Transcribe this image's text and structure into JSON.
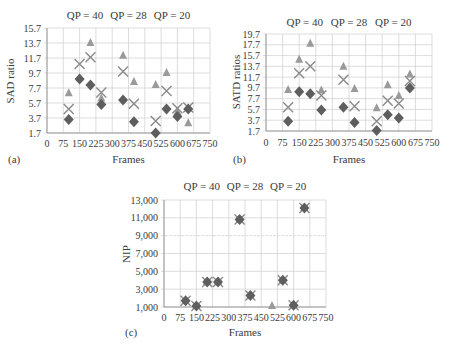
{
  "chart_data": [
    {
      "panel": "(a)",
      "type": "scatter",
      "title": "",
      "xlabel": "Frames",
      "ylabel": "SAD ratio",
      "xlim": [
        0,
        750
      ],
      "ylim": [
        1.7,
        15.7
      ],
      "xticks": [
        "0",
        "75",
        "150",
        "225",
        "300",
        "375",
        "450",
        "525",
        "600",
        "675",
        "750"
      ],
      "yticks": [
        "1.7",
        "3.7",
        "5.7",
        "7.7",
        "9.7",
        "11.7",
        "13.7",
        "15.7"
      ],
      "grid": true,
      "annotations": [
        "QP = 40",
        "QP = 28",
        "QP = 20"
      ],
      "x": [
        100,
        150,
        200,
        250,
        350,
        400,
        500,
        550,
        600,
        650
      ],
      "series": [
        {
          "name": "triangle",
          "marker": "triangle",
          "values": [
            7.0,
            9.0,
            13.7,
            6.3,
            12.0,
            8.5,
            8.1,
            9.7,
            4.5,
            3.0
          ]
        },
        {
          "name": "cross",
          "marker": "x",
          "values": [
            4.9,
            10.9,
            11.8,
            7.1,
            9.9,
            5.6,
            3.3,
            7.3,
            5.0,
            5.1
          ]
        },
        {
          "name": "diamond",
          "marker": "diamond",
          "values": [
            3.5,
            8.9,
            8.1,
            5.5,
            6.1,
            3.2,
            1.7,
            4.9,
            3.9,
            4.9
          ]
        }
      ]
    },
    {
      "panel": "(b)",
      "type": "scatter",
      "title": "",
      "xlabel": "Frames",
      "ylabel": "SATD ratios",
      "xlim": [
        0,
        750
      ],
      "ylim": [
        1.7,
        19.7
      ],
      "xticks": [
        "0",
        "75",
        "150",
        "225",
        "300",
        "375",
        "450",
        "525",
        "600",
        "675",
        "750"
      ],
      "yticks": [
        "1.7",
        "3.7",
        "5.7",
        "7.7",
        "9.7",
        "11.7",
        "13.7",
        "15.7",
        "17.7",
        "19.7"
      ],
      "grid": true,
      "annotations": [
        "QP = 40",
        "QP = 28",
        "QP = 20"
      ],
      "x": [
        100,
        150,
        200,
        250,
        350,
        400,
        500,
        550,
        600,
        650
      ],
      "series": [
        {
          "name": "triangle",
          "marker": "triangle",
          "values": [
            9.3,
            14.9,
            17.9,
            9.2,
            13.6,
            9.5,
            5.9,
            10.2,
            8.2,
            12.2
          ]
        },
        {
          "name": "cross",
          "marker": "x",
          "values": [
            6.1,
            12.4,
            13.7,
            8.3,
            11.2,
            6.3,
            3.5,
            7.3,
            6.8,
            11.0
          ]
        },
        {
          "name": "diamond",
          "marker": "diamond",
          "values": [
            3.5,
            9.0,
            8.6,
            5.6,
            6.1,
            3.3,
            1.8,
            4.7,
            4.1,
            9.7
          ]
        }
      ]
    },
    {
      "panel": "(c)",
      "type": "scatter",
      "title": "",
      "xlabel": "Frames",
      "ylabel": "NIP",
      "xlim": [
        0,
        750
      ],
      "ylim": [
        1000,
        13000
      ],
      "xticks": [
        "0",
        "75",
        "150",
        "225",
        "300",
        "375",
        "450",
        "525",
        "600",
        "675",
        "750"
      ],
      "yticks": [
        "1,000",
        "3,000",
        "5,000",
        "7,000",
        "9,000",
        "11,000",
        "13,000"
      ],
      "grid": true,
      "annotations": [
        "QP = 40",
        "QP = 28",
        "QP = 20"
      ],
      "x": [
        100,
        150,
        200,
        250,
        350,
        400,
        500,
        550,
        600,
        650
      ],
      "series": [
        {
          "name": "triangle",
          "marker": "triangle",
          "values": [
            1700,
            1100,
            3800,
            3800,
            10800,
            2300,
            1100,
            4000,
            1200,
            12100
          ]
        },
        {
          "name": "cross",
          "marker": "x",
          "values": [
            1700,
            1100,
            3800,
            3800,
            10800,
            2300,
            null,
            4000,
            1200,
            12100
          ]
        },
        {
          "name": "diamond",
          "marker": "diamond",
          "values": [
            1700,
            1100,
            3800,
            3800,
            10800,
            2300,
            null,
            4000,
            1200,
            12100
          ]
        }
      ]
    }
  ],
  "colors": {
    "triangle": "#9a9a9a",
    "cross": "#8a8a8a",
    "diamond": "#5e5e5e",
    "grid": "#cfcfcf",
    "axis": "#999999"
  }
}
